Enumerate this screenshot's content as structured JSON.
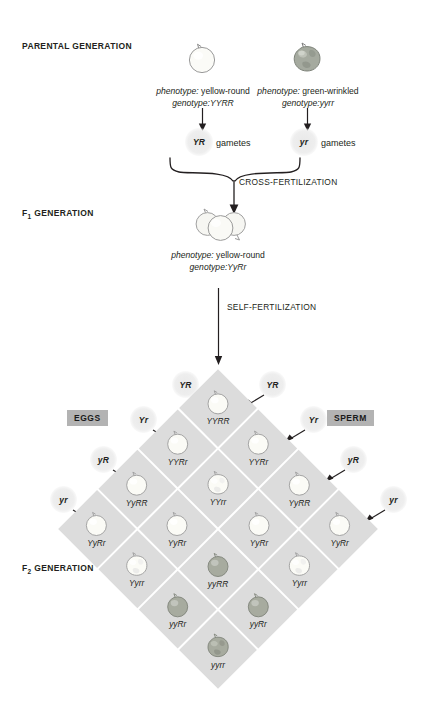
{
  "parental": {
    "generation_label": "PARENTAL GENERATION",
    "left_parent": {
      "phenotype_key": "phenotype:",
      "phenotype_value": " yellow-round",
      "genotype_key": "genotype:",
      "genotype_value": "YYRR",
      "seed_type": "yellow-round"
    },
    "right_parent": {
      "phenotype_key": "phenotype:",
      "phenotype_value": " green-wrinkled",
      "genotype_key": "genotype:",
      "genotype_value": "yyrr",
      "seed_type": "green-wrinkled"
    },
    "left_gamete": "YR",
    "right_gamete": "yr",
    "gametes_word": "gametes"
  },
  "cross_fertilization_label": "CROSS-FERTILIZATION",
  "f1": {
    "generation_label_prefix": "F",
    "generation_label_sub": "1",
    "generation_label_suffix": " GENERATION",
    "phenotype_key": "phenotype:",
    "phenotype_value": " yellow-round",
    "genotype_key": "genotype:",
    "genotype_value": "YyRr"
  },
  "self_fertilization_label": "SELF-FERTILIZATION",
  "f2": {
    "generation_label_prefix": "F",
    "generation_label_sub": "2",
    "generation_label_suffix": " GENERATION",
    "eggs_label": "EGGS",
    "sperm_label": "SPERM",
    "egg_gametes": [
      "YR",
      "Yr",
      "yR",
      "yr"
    ],
    "sperm_gametes": [
      "YR",
      "Yr",
      "yR",
      "yr"
    ]
  },
  "punnett": {
    "type": "dihybrid-punnett-square",
    "rows": [
      "YR",
      "Yr",
      "yR",
      "yr"
    ],
    "cols": [
      "YR",
      "Yr",
      "yR",
      "yr"
    ],
    "cells": [
      [
        {
          "genotype": "YYRR",
          "seed": "yellow-round"
        },
        {
          "genotype": "YYRr",
          "seed": "yellow-round"
        },
        {
          "genotype": "YyRR",
          "seed": "yellow-round"
        },
        {
          "genotype": "YyRr",
          "seed": "yellow-round"
        }
      ],
      [
        {
          "genotype": "YYRr",
          "seed": "yellow-round"
        },
        {
          "genotype": "YYrr",
          "seed": "yellow-wrinkled"
        },
        {
          "genotype": "YyRr",
          "seed": "yellow-round"
        },
        {
          "genotype": "Yyrr",
          "seed": "yellow-wrinkled"
        }
      ],
      [
        {
          "genotype": "YyRR",
          "seed": "yellow-round"
        },
        {
          "genotype": "YyRr",
          "seed": "yellow-round"
        },
        {
          "genotype": "yyRR",
          "seed": "green-round"
        },
        {
          "genotype": "yyRr",
          "seed": "green-round"
        }
      ],
      [
        {
          "genotype": "YyRr",
          "seed": "yellow-round"
        },
        {
          "genotype": "Yyrr",
          "seed": "yellow-wrinkled"
        },
        {
          "genotype": "yyRr",
          "seed": "green-round"
        },
        {
          "genotype": "yyrr",
          "seed": "green-wrinkled"
        }
      ]
    ]
  },
  "colors": {
    "cell_fill": "#dcdcdc",
    "chip_fill": "#b3b3b3",
    "text": "#231f20",
    "yellow_seed": "#f7f7f2",
    "green_seed": "#9aa394",
    "outline": "#8a8a8a"
  }
}
